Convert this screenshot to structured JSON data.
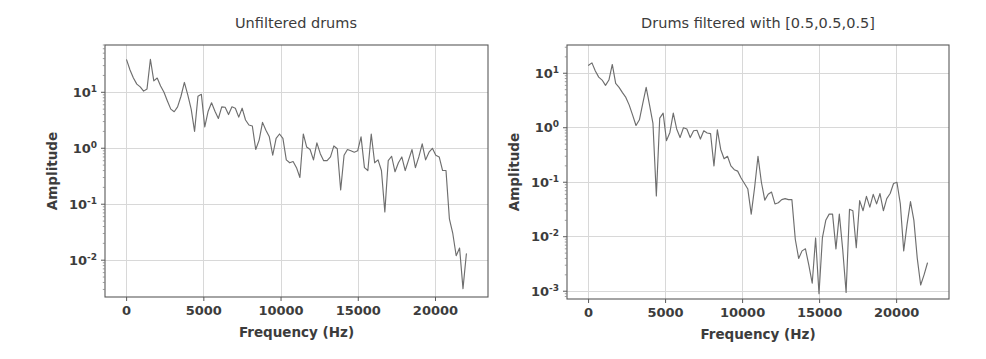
{
  "figure": {
    "background_color": "#ffffff",
    "line_color": "#6e6e6e",
    "grid_color": "#d8d8d8",
    "spine_color": "#5a5a5a",
    "text_color": "#3c3c3c"
  },
  "chart_data": [
    {
      "type": "line",
      "title": "Unfiltered drums",
      "xlabel": "Frequency (Hz)",
      "ylabel": "Amplitude",
      "yscale": "log",
      "xscale": "linear",
      "grid": true,
      "legend": "none",
      "xlim": [
        -1400,
        23400
      ],
      "ylim": [
        0.0022,
        70
      ],
      "xticks": [
        0,
        5000,
        10000,
        15000,
        20000
      ],
      "xticklabels": [
        "0",
        "5000",
        "10000",
        "15000",
        "20000"
      ],
      "yticks": [
        10,
        1,
        0.1,
        0.01
      ],
      "yticklabels": [
        "10^1",
        "10^0",
        "10^-1",
        "10^-2"
      ],
      "ytick_mantissas": [
        "10",
        "10",
        "10",
        "10"
      ],
      "ytick_exponents": [
        "1",
        "0",
        "-1",
        "-2"
      ],
      "x": [
        0,
        220,
        440,
        660,
        880,
        1100,
        1320,
        1540,
        1760,
        1980,
        2200,
        2420,
        2640,
        2860,
        3080,
        3300,
        3520,
        3740,
        3960,
        4180,
        4400,
        4620,
        4840,
        5060,
        5280,
        5500,
        5720,
        5940,
        6160,
        6380,
        6600,
        6820,
        7040,
        7260,
        7480,
        7700,
        7920,
        8140,
        8360,
        8580,
        8800,
        9020,
        9240,
        9460,
        9680,
        9900,
        10120,
        10340,
        10560,
        10780,
        11000,
        11220,
        11440,
        11660,
        11880,
        12100,
        12320,
        12540,
        12760,
        12980,
        13200,
        13420,
        13640,
        13860,
        14080,
        14300,
        14520,
        14740,
        14960,
        15180,
        15400,
        15620,
        15840,
        16060,
        16280,
        16500,
        16720,
        16940,
        17160,
        17380,
        17600,
        17820,
        18040,
        18260,
        18480,
        18700,
        18920,
        19140,
        19360,
        19580,
        19800,
        20020,
        20240,
        20460,
        20680,
        20900,
        21120,
        21340,
        21560,
        21780,
        22000
      ],
      "y": [
        38.0,
        25.0,
        18.0,
        14.0,
        12.5,
        10.5,
        11.5,
        39.0,
        16.0,
        18.0,
        13.0,
        10.0,
        7.0,
        5.0,
        4.5,
        5.5,
        8.5,
        15.0,
        9.0,
        5.0,
        2.0,
        8.5,
        9.2,
        2.4,
        4.6,
        6.5,
        4.6,
        3.4,
        5.5,
        5.4,
        4.0,
        5.5,
        5.2,
        3.6,
        5.2,
        3.2,
        2.6,
        2.5,
        0.95,
        1.4,
        2.9,
        2.1,
        1.6,
        0.75,
        1.5,
        1.8,
        1.5,
        0.62,
        0.55,
        0.58,
        0.45,
        0.3,
        1.8,
        1.05,
        0.95,
        0.62,
        1.25,
        0.8,
        0.6,
        0.6,
        0.7,
        1.1,
        0.98,
        0.18,
        0.75,
        0.95,
        0.9,
        0.85,
        0.9,
        1.6,
        0.45,
        0.4,
        1.8,
        0.55,
        0.62,
        0.4,
        0.073,
        0.6,
        0.72,
        0.38,
        0.55,
        0.7,
        0.4,
        0.62,
        0.95,
        0.45,
        0.7,
        1.2,
        0.62,
        0.85,
        1.0,
        0.75,
        0.7,
        0.4,
        0.4,
        0.055,
        0.03,
        0.012,
        0.0165,
        0.0031,
        0.013
      ]
    },
    {
      "type": "line",
      "title": "Drums filtered with [0.5,0.5,0.5]",
      "xlabel": "Frequency (Hz)",
      "ylabel": "Amplitude",
      "yscale": "log",
      "xscale": "linear",
      "grid": true,
      "legend": "none",
      "xlim": [
        -1400,
        23400
      ],
      "ylim": [
        0.00072,
        33
      ],
      "xticks": [
        0,
        5000,
        10000,
        15000,
        20000
      ],
      "xticklabels": [
        "0",
        "5000",
        "10000",
        "15000",
        "20000"
      ],
      "yticks": [
        10,
        1,
        0.1,
        0.01,
        0.001
      ],
      "yticklabels": [
        "10^1",
        "10^0",
        "10^-1",
        "10^-2",
        "10^-3"
      ],
      "ytick_mantissas": [
        "10",
        "10",
        "10",
        "10",
        "10"
      ],
      "ytick_exponents": [
        "1",
        "0",
        "-1",
        "-2",
        "-3"
      ],
      "x": [
        0,
        220,
        440,
        660,
        880,
        1100,
        1320,
        1540,
        1760,
        1980,
        2200,
        2420,
        2640,
        2860,
        3080,
        3300,
        3520,
        3740,
        3960,
        4180,
        4400,
        4620,
        4840,
        5060,
        5280,
        5500,
        5720,
        5940,
        6160,
        6380,
        6600,
        6820,
        7040,
        7260,
        7480,
        7700,
        7920,
        8140,
        8360,
        8580,
        8800,
        9020,
        9240,
        9460,
        9680,
        9900,
        10120,
        10340,
        10560,
        10780,
        11000,
        11220,
        11440,
        11660,
        11880,
        12100,
        12320,
        12540,
        12760,
        12980,
        13200,
        13420,
        13640,
        13860,
        14080,
        14300,
        14520,
        14740,
        14960,
        15180,
        15400,
        15620,
        15840,
        16060,
        16280,
        16500,
        16720,
        16940,
        17160,
        17380,
        17600,
        17820,
        18040,
        18260,
        18480,
        18700,
        18920,
        19140,
        19360,
        19580,
        19800,
        20020,
        20240,
        20460,
        20680,
        20900,
        21120,
        21340,
        21560,
        21780,
        22000
      ],
      "y": [
        14.0,
        15.5,
        11.0,
        8.5,
        7.5,
        6.0,
        7.5,
        14.5,
        6.5,
        5.5,
        4.4,
        3.6,
        2.6,
        1.7,
        1.1,
        1.4,
        2.8,
        5.5,
        2.6,
        1.2,
        0.056,
        1.5,
        1.85,
        0.58,
        0.82,
        1.85,
        0.95,
        0.66,
        1.0,
        0.95,
        0.66,
        0.88,
        0.9,
        0.62,
        0.88,
        0.8,
        0.78,
        0.2,
        0.92,
        0.4,
        0.27,
        0.3,
        0.2,
        0.17,
        0.16,
        0.12,
        0.095,
        0.075,
        0.026,
        0.08,
        0.3,
        0.1,
        0.047,
        0.06,
        0.066,
        0.04,
        0.042,
        0.048,
        0.05,
        0.048,
        0.048,
        0.009,
        0.004,
        0.0055,
        0.006,
        0.003,
        0.0014,
        0.0095,
        0.0009,
        0.0095,
        0.02,
        0.026,
        0.026,
        0.006,
        0.026,
        0.0058,
        0.00095,
        0.032,
        0.03,
        0.0063,
        0.046,
        0.03,
        0.055,
        0.035,
        0.06,
        0.04,
        0.062,
        0.03,
        0.05,
        0.062,
        0.095,
        0.1,
        0.04,
        0.0055,
        0.017,
        0.044,
        0.02,
        0.004,
        0.0013,
        0.002,
        0.0033
      ]
    }
  ]
}
